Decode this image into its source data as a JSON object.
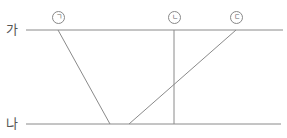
{
  "diagram": {
    "lines": [
      {
        "id": "ga",
        "label": "가",
        "y": 30
      },
      {
        "id": "na",
        "label": "나",
        "y": 124
      }
    ],
    "markers": [
      {
        "id": "giyeok",
        "label": "ㄱ",
        "x": 58
      },
      {
        "id": "nieun",
        "label": "ㄴ",
        "x": 174
      },
      {
        "id": "digeut",
        "label": "ㄷ",
        "x": 236
      }
    ],
    "colors": {
      "line": "#8a8a8a",
      "text": "#555555"
    }
  }
}
